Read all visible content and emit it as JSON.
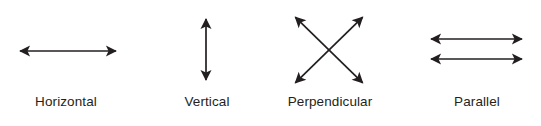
{
  "figure": {
    "width": 541,
    "height": 126,
    "background_color": "#ffffff",
    "stroke_color": "#231f20",
    "text_color": "#231f20"
  },
  "items": [
    {
      "id": "horizontal",
      "label": "Horizontal",
      "label_center_x": 66,
      "glyph": "double-headed-horizontal-arrow",
      "arrows": [
        {
          "x1": 14,
          "y1": 51,
          "x2": 122,
          "y2": 51,
          "heads": "both"
        }
      ]
    },
    {
      "id": "vertical",
      "label": "Vertical",
      "label_center_x": 207,
      "glyph": "double-headed-vertical-arrow",
      "arrows": [
        {
          "x1": 206,
          "y1": 13,
          "x2": 206,
          "y2": 86,
          "heads": "both"
        }
      ]
    },
    {
      "id": "perpendicular",
      "label": "Perpendicular",
      "label_center_x": 330,
      "glyph": "crossed-double-headed-arrows",
      "arrows": [
        {
          "x1": 291,
          "y1": 87,
          "x2": 367,
          "y2": 13,
          "heads": "both"
        },
        {
          "x1": 291,
          "y1": 13,
          "x2": 367,
          "y2": 87,
          "heads": "both"
        }
      ]
    },
    {
      "id": "parallel",
      "label": "Parallel",
      "label_center_x": 477,
      "glyph": "two-parallel-double-headed-arrows",
      "arrows": [
        {
          "x1": 425,
          "y1": 39,
          "x2": 528,
          "y2": 39,
          "heads": "both"
        },
        {
          "x1": 425,
          "y1": 59,
          "x2": 528,
          "y2": 59,
          "heads": "both"
        }
      ]
    }
  ]
}
